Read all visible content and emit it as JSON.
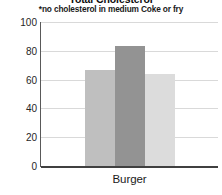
{
  "chart_data": {
    "type": "bar",
    "title": "Total Cholesterol",
    "subtitle": "*no cholesterol in medium Coke or fry",
    "xlabel": "",
    "ylabel": "",
    "categories": [
      "Burger"
    ],
    "series": [
      {
        "name": "Series 1",
        "values": [
          67
        ],
        "color": "#bfbfbf"
      },
      {
        "name": "Series 2",
        "values": [
          83
        ],
        "color": "#939393"
      },
      {
        "name": "Series 3",
        "values": [
          64
        ],
        "color": "#dcdcdc"
      }
    ],
    "ylim": [
      0,
      100
    ],
    "yticks": [
      0,
      20,
      40,
      60,
      80,
      100
    ],
    "ytick_labels": [
      "0",
      "20",
      "40",
      "60",
      "80",
      "100"
    ],
    "grid": true,
    "grid_color": "#d9d9d9",
    "legend": "none",
    "axis_color": "#595959",
    "background": "#ffffff"
  }
}
